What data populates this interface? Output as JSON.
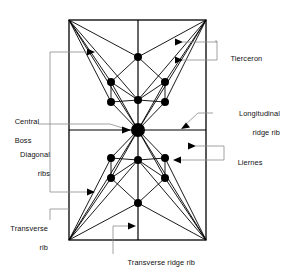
{
  "figure": {
    "type": "architectural-plan-diagram",
    "background_color": "#ffffff",
    "line_color": "#000000",
    "leader_color": "#8c8c8c"
  },
  "labels": {
    "tierceron": "Tierceron",
    "longitudinal_ridge_rib_line1": "Longitudinal",
    "longitudinal_ridge_rib_line2": "ridge rib",
    "liernes": "Liernes",
    "central_boss_line1": "Central",
    "central_boss_line2": "Boss",
    "diagonal_ribs_line1": "Diagonal",
    "diagonal_ribs_line2": "ribs",
    "transverse_rib_line1": "Transverse",
    "transverse_rib_line2": "rib",
    "transverse_ridge_rib": "Transverse ridge rib"
  },
  "geometry": {
    "bay_left": 69,
    "bay_right": 206,
    "bay_top": 20,
    "bay_bottom": 240,
    "center_x": 138,
    "center_y": 130,
    "central_boss_radius": 7,
    "boss_radius": 4,
    "small_boss_radius": 3.4,
    "ridge_nodes_y": [
      57,
      100,
      160,
      203
    ],
    "quadrant_boss_offsets": [
      {
        "dx": -27,
        "dy": -48
      },
      {
        "dx": -27,
        "dy": -28
      },
      {
        "dx": 27,
        "dy": -48
      },
      {
        "dx": 27,
        "dy": -28
      },
      {
        "dx": -27,
        "dy": 28
      },
      {
        "dx": -27,
        "dy": 48
      },
      {
        "dx": 27,
        "dy": 28
      },
      {
        "dx": 27,
        "dy": 48
      }
    ]
  }
}
